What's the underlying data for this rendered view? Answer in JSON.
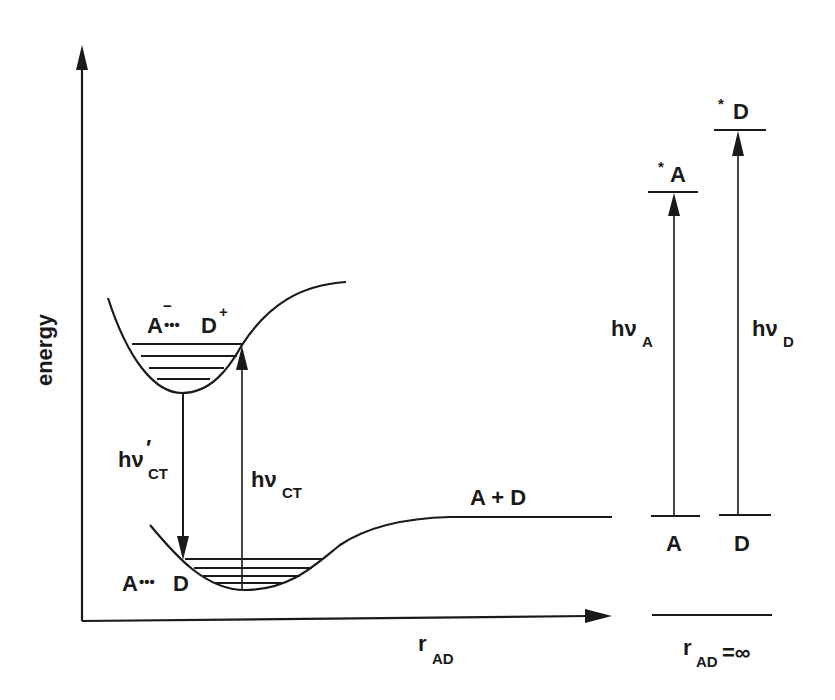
{
  "diagram": {
    "type": "potential-energy-diagram",
    "axes": {
      "y_label": "energy",
      "x_label_main": "r",
      "x_label_sub": "AD",
      "infinity_label_main": "r",
      "infinity_label_sub": "AD",
      "infinity_label_tail": "=∞"
    },
    "curves": {
      "upper_state": {
        "label_left": "A",
        "label_minus": "−",
        "label_dots": "•••",
        "label_right": "D",
        "label_plus": "+"
      },
      "lower_state": {
        "label_left": "A",
        "label_dots": "•••",
        "label_right": "D"
      },
      "asymptote": {
        "label": "A + D"
      }
    },
    "transitions": {
      "emission_ct": {
        "main": "hν",
        "prime": "′",
        "sub": "CT"
      },
      "absorption_ct": {
        "main": "hν",
        "sub": "CT"
      },
      "excitation_a": {
        "main": "hν",
        "sub": "A"
      },
      "excitation_d": {
        "main": "hν",
        "sub": "D"
      }
    },
    "levels": {
      "ground_a": "A",
      "ground_d": "D",
      "excited_a_star": "*",
      "excited_a": "A",
      "excited_d_star": "*",
      "excited_d": "D"
    },
    "colors": {
      "ink": "#1a1a1a",
      "background": "#ffffff"
    }
  }
}
